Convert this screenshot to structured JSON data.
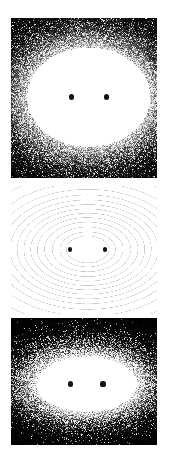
{
  "figure": {
    "background_color": "#ffffff",
    "width": 169,
    "height": 449,
    "panel_count": 3
  },
  "panels": [
    {
      "id": "panel-top-density",
      "label": "Top density map",
      "render_type": "scatter-density",
      "background_color": "#000000",
      "foreground_color": "#ffffff",
      "marker_color": "#141414",
      "x": 11,
      "y": 18,
      "width": 146,
      "height": 160,
      "noise_points": 26000,
      "halo_shape": "broad-elliptical",
      "halo_sigma_x": 0.3,
      "halo_sigma_y": 0.24,
      "core_peak_brightness": 1.0,
      "sources": [
        {
          "name": "source-left",
          "cx": 0.412,
          "cy": 0.494,
          "radius_px": 2.6
        },
        {
          "name": "source-right",
          "cx": 0.652,
          "cy": 0.494,
          "radius_px": 2.6
        }
      ]
    },
    {
      "id": "panel-middle-contour",
      "label": "Middle contour map",
      "render_type": "contour",
      "background_color": "#ffffff",
      "contour_color": "#c9c9c9",
      "contour_line_width": 0.5,
      "marker_color": "#141414",
      "x": 11,
      "y": 186,
      "width": 146,
      "height": 128,
      "contour_levels": 13,
      "outer_level_radius": 0.95,
      "inner_level_radius": 0.12,
      "sources": [
        {
          "name": "source-left",
          "cx": 0.405,
          "cy": 0.495,
          "radius_px": 2.2
        },
        {
          "name": "source-right",
          "cx": 0.645,
          "cy": 0.495,
          "radius_px": 2.2
        }
      ]
    },
    {
      "id": "panel-bottom-density",
      "label": "Bottom density map",
      "render_type": "scatter-density",
      "background_color": "#000000",
      "foreground_color": "#ffffff",
      "marker_color": "#141414",
      "x": 11,
      "y": 318,
      "width": 146,
      "height": 127,
      "noise_points": 24000,
      "halo_shape": "compact-bilobed",
      "halo_sigma_x": 0.24,
      "halo_sigma_y": 0.17,
      "core_peak_brightness": 1.0,
      "sources": [
        {
          "name": "source-left",
          "cx": 0.405,
          "cy": 0.52,
          "radius_px": 2.6
        },
        {
          "name": "source-right",
          "cx": 0.63,
          "cy": 0.52,
          "radius_px": 2.6
        }
      ]
    }
  ],
  "chart_data": {
    "type": "heatmap",
    "subtitle": "",
    "xlabel": "",
    "ylabel": "",
    "grid": false,
    "legend_position": "none",
    "axis_ticks_visible": false,
    "xlim": [
      -1,
      1
    ],
    "ylim": [
      -1,
      1
    ],
    "sources": [
      {
        "name": "source-left",
        "x": -0.18,
        "y": 0.0,
        "weight": 1.0
      },
      {
        "name": "source-right",
        "x": 0.3,
        "y": 0.0,
        "weight": 1.0
      }
    ],
    "series": [
      {
        "name": "Top density map",
        "panel": "panel-top-density",
        "render": "scatter-density",
        "sigma_x": 0.3,
        "sigma_y": 0.24,
        "peak": 1.0,
        "samples": 26000
      },
      {
        "name": "Middle contour map",
        "panel": "panel-middle-contour",
        "render": "contour",
        "levels": [
          0.02,
          0.05,
          0.09,
          0.14,
          0.2,
          0.27,
          0.35,
          0.44,
          0.54,
          0.65,
          0.77,
          0.88,
          0.96
        ],
        "level_count": 13
      },
      {
        "name": "Bottom density map",
        "panel": "panel-bottom-density",
        "render": "scatter-density",
        "sigma_x": 0.24,
        "sigma_y": 0.17,
        "peak": 1.0,
        "samples": 24000
      }
    ]
  }
}
